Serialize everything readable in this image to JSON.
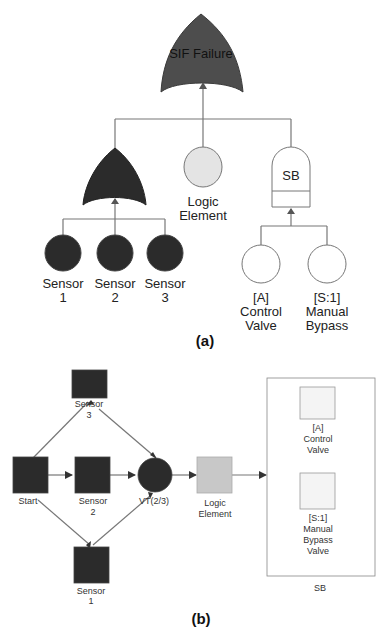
{
  "colors": {
    "dark": "#2b2b2b",
    "gate_top": "#4d4d4d",
    "light_fill": "#e4e4e4",
    "white_fill": "#ffffff",
    "line": "#777777",
    "logic_box_b": "#c8c8c8",
    "valve_box_b": "#f4f4f4"
  },
  "diagram_a": {
    "caption": "(a)",
    "top_gate": {
      "label": "SIF Failure",
      "type": "OR gate"
    },
    "sensor_gate": {
      "type": "OR gate"
    },
    "logic_element": {
      "line1": "Logic",
      "line2": "Element"
    },
    "sb": {
      "label": "SB",
      "type": "SPARE/standby gate"
    },
    "sensors": [
      {
        "line1": "Sensor",
        "line2": "1"
      },
      {
        "line1": "Sensor",
        "line2": "2"
      },
      {
        "line1": "Sensor",
        "line2": "3"
      }
    ],
    "control_valve": {
      "line1": "[A]",
      "line2": "Control",
      "line3": "Valve"
    },
    "manual_bypass": {
      "line1": "[S:1]",
      "line2": "Manual",
      "line3": "Bypass"
    }
  },
  "diagram_b": {
    "caption": "(b)",
    "start": {
      "label": "Start"
    },
    "sensor3": {
      "line1": "Sensor",
      "line2": "3"
    },
    "sensor2": {
      "line1": "Sensor",
      "line2": "2"
    },
    "sensor1": {
      "line1": "Sensor",
      "line2": "1"
    },
    "voter": {
      "label": "VT(2/3)"
    },
    "logic_element": {
      "line1": "Logic",
      "line2": "Element"
    },
    "sb_container": {
      "label": "SB",
      "control_valve": {
        "line1": "[A]",
        "line2": "Control",
        "line3": "Valve"
      },
      "manual_bypass": {
        "line1": "[S:1]",
        "line2": "Manual",
        "line3": "Bypass",
        "line4": "Valve"
      }
    }
  }
}
